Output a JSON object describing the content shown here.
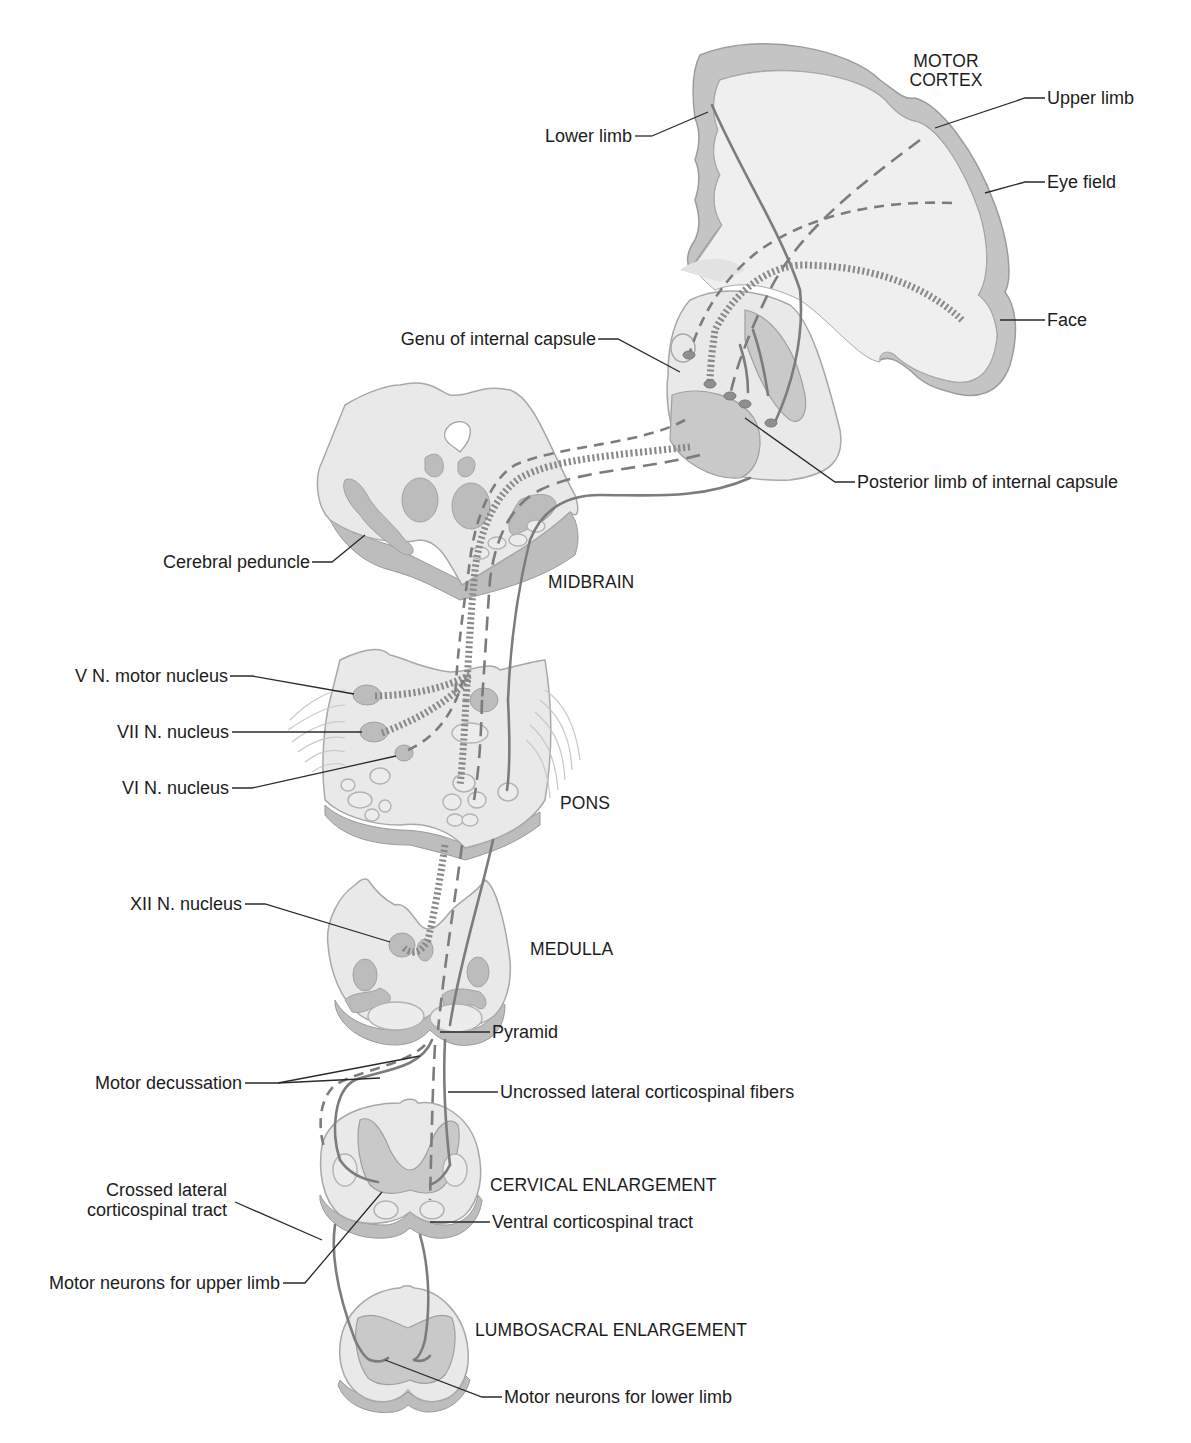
{
  "figure": {
    "regions": {
      "motor_cortex": "MOTOR\nCORTEX",
      "midbrain": "MIDBRAIN",
      "pons": "PONS",
      "medulla": "MEDULLA",
      "cervical": "CERVICAL ENLARGEMENT",
      "lumbosacral": "LUMBOSACRAL ENLARGEMENT"
    },
    "labels": {
      "upper_limb": "Upper limb",
      "lower_limb": "Lower limb",
      "eye_field": "Eye field",
      "face": "Face",
      "genu": "Genu of internal capsule",
      "posterior_limb": "Posterior limb of internal capsule",
      "cerebral_peduncle": "Cerebral peduncle",
      "v_nucleus": "V N. motor nucleus",
      "vii_nucleus": "VII N. nucleus",
      "vi_nucleus": "VI N. nucleus",
      "xii_nucleus": "XII N. nucleus",
      "pyramid": "Pyramid",
      "motor_decussation": "Motor decussation",
      "uncrossed_fibers": "Uncrossed lateral corticospinal fibers",
      "crossed_tract_line1": "Crossed lateral",
      "crossed_tract_line2": "corticospinal tract",
      "ventral_tract": "Ventral corticospinal tract",
      "motor_neurons_upper": "Motor neurons for upper limb",
      "motor_neurons_lower": "Motor neurons for lower limb"
    },
    "colors": {
      "tissue": "#e9e9e9",
      "gray_matter": "#c4c4c4",
      "tract": "#7c7c7c",
      "label_text": "#1c1c1c"
    }
  }
}
